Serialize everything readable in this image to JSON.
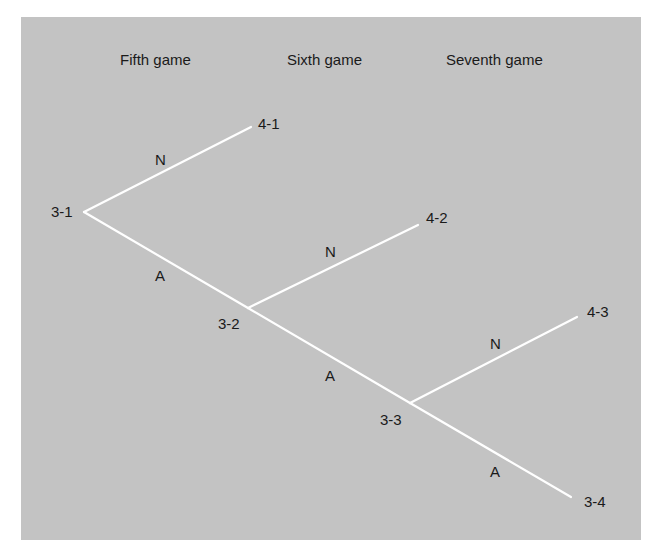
{
  "headers": {
    "fifth": "Fifth game",
    "sixth": "Sixth game",
    "seventh": "Seventh game"
  },
  "nodes": {
    "n31": "3-1",
    "n41": "4-1",
    "n32": "3-2",
    "n42": "4-2",
    "n33": "3-3",
    "n43": "4-3",
    "n34": "3-4"
  },
  "edges": {
    "e1_N": "N",
    "e1_A": "A",
    "e2_N": "N",
    "e2_A": "A",
    "e3_N": "N",
    "e3_A": "A"
  },
  "colors": {
    "background": "#c3c3c3",
    "lines": "#ffffff",
    "text": "#1a1a1a"
  }
}
